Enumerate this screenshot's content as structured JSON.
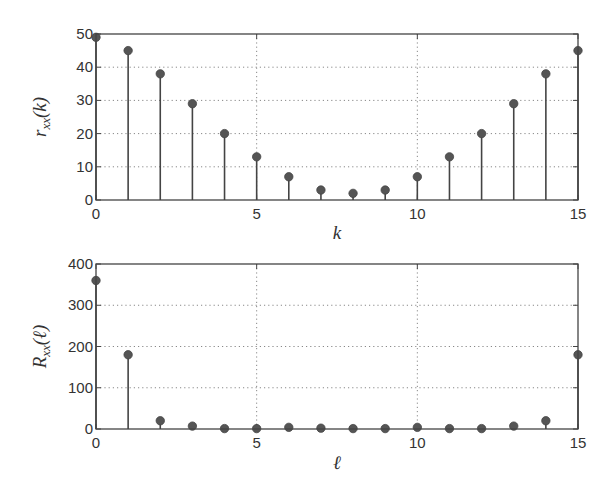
{
  "colors": {
    "frame": "#444444",
    "grid": "#888888",
    "stem": "#444444",
    "marker": "#555555",
    "text": "#333333"
  },
  "chart_data": [
    {
      "type": "stem",
      "title": "",
      "xlabel": "k",
      "ylabel": "r_xx(k)",
      "ylabel_main": "r",
      "ylabel_sub": "xx",
      "ylabel_arg": "(k)",
      "xlim": [
        0,
        15
      ],
      "ylim": [
        0,
        50
      ],
      "xticks": [
        0,
        5,
        10,
        15
      ],
      "yticks": [
        0,
        10,
        20,
        30,
        40,
        50
      ],
      "grid": true,
      "x": [
        0,
        1,
        2,
        3,
        4,
        5,
        6,
        7,
        8,
        9,
        10,
        11,
        12,
        13,
        14,
        15
      ],
      "values": [
        49,
        45,
        38,
        29,
        20,
        13,
        7,
        3,
        2,
        3,
        7,
        13,
        20,
        29,
        38,
        45
      ]
    },
    {
      "type": "stem",
      "title": "",
      "xlabel": "ℓ",
      "ylabel": "R_xx(ℓ)",
      "ylabel_main": "R",
      "ylabel_sub": "xx",
      "ylabel_arg": "(ℓ)",
      "xlim": [
        0,
        15
      ],
      "ylim": [
        0,
        400
      ],
      "xticks": [
        0,
        5,
        10,
        15
      ],
      "yticks": [
        0,
        100,
        200,
        300,
        400
      ],
      "grid": true,
      "x": [
        0,
        1,
        2,
        3,
        4,
        5,
        6,
        7,
        8,
        9,
        10,
        11,
        12,
        13,
        14,
        15
      ],
      "values": [
        360,
        180,
        20,
        7,
        1,
        1,
        4,
        2,
        1,
        1,
        4,
        1,
        1,
        7,
        20,
        180
      ]
    }
  ]
}
